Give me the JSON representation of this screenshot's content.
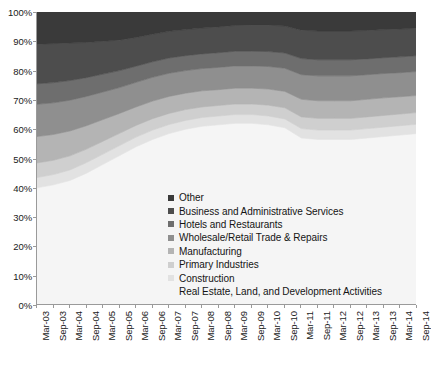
{
  "chart_data": {
    "type": "area",
    "title": "",
    "xlabel": "",
    "ylabel": "",
    "stacked": true,
    "normalized": true,
    "grid": false,
    "legend_position": "inside-center-lower",
    "ylim": [
      0,
      100
    ],
    "ytick_labels": [
      "0%",
      "10%",
      "20%",
      "30%",
      "40%",
      "50%",
      "60%",
      "70%",
      "80%",
      "90%",
      "100%"
    ],
    "ytick_values": [
      0,
      10,
      20,
      30,
      40,
      50,
      60,
      70,
      80,
      90,
      100
    ],
    "categories": [
      "Mar-03",
      "Sep-03",
      "Mar-04",
      "Sep-04",
      "Mar-05",
      "Sep-05",
      "Mar-06",
      "Sep-06",
      "Mar-07",
      "Sep-07",
      "Mar-08",
      "Sep-08",
      "Mar-09",
      "Sep-09",
      "Mar-10",
      "Sep-10",
      "Mar-11",
      "Sep-11",
      "Mar-12",
      "Sep-12",
      "Mar-13",
      "Sep-13",
      "Mar-14",
      "Sep-14"
    ],
    "series": [
      {
        "name": "Real Estate, Land, and Development Activities",
        "color": "#f5f5f5",
        "values": [
          40.0,
          41.0,
          42.5,
          45.0,
          48.0,
          51.0,
          54.0,
          56.5,
          58.5,
          60.0,
          61.0,
          61.5,
          62.0,
          62.0,
          61.5,
          60.5,
          57.0,
          56.5,
          56.5,
          56.5,
          57.0,
          57.5,
          58.0,
          58.5
        ]
      },
      {
        "name": "Construction",
        "color": "#e2e2e2",
        "values": [
          3.5,
          3.5,
          3.6,
          3.6,
          3.5,
          3.4,
          3.3,
          3.2,
          3.1,
          3.0,
          3.0,
          3.0,
          3.0,
          3.0,
          3.0,
          3.0,
          3.2,
          3.2,
          3.2,
          3.2,
          3.2,
          3.2,
          3.2,
          3.2
        ]
      },
      {
        "name": "Primary Industries",
        "color": "#cfcfcf",
        "values": [
          5.0,
          4.9,
          4.8,
          4.6,
          4.4,
          4.2,
          4.0,
          3.9,
          3.8,
          3.7,
          3.6,
          3.6,
          3.6,
          3.6,
          3.7,
          3.8,
          4.0,
          4.0,
          4.0,
          4.0,
          4.0,
          4.0,
          4.0,
          4.0
        ]
      },
      {
        "name": "Manufacturing",
        "color": "#b4b4b4",
        "values": [
          9.0,
          8.8,
          8.5,
          8.0,
          7.4,
          6.8,
          6.3,
          6.0,
          5.8,
          5.6,
          5.5,
          5.4,
          5.4,
          5.4,
          5.5,
          5.6,
          6.0,
          6.0,
          6.0,
          6.0,
          6.0,
          6.0,
          5.9,
          5.8
        ]
      },
      {
        "name": "Wholesale/Retail Trade & Repairs",
        "color": "#8f8f8f",
        "values": [
          11.0,
          10.8,
          10.5,
          10.0,
          9.4,
          8.8,
          8.4,
          8.1,
          7.9,
          7.7,
          7.6,
          7.6,
          7.6,
          7.6,
          7.7,
          7.9,
          8.4,
          8.5,
          8.5,
          8.5,
          8.4,
          8.3,
          8.2,
          8.2
        ]
      },
      {
        "name": "Hotels and Restaurants",
        "color": "#6e6e6e",
        "values": [
          7.0,
          6.9,
          6.7,
          6.4,
          6.1,
          5.8,
          5.5,
          5.3,
          5.2,
          5.1,
          5.0,
          5.0,
          5.0,
          5.0,
          5.1,
          5.2,
          5.5,
          5.5,
          5.5,
          5.5,
          5.4,
          5.4,
          5.4,
          5.4
        ]
      },
      {
        "name": "Business and Administrative Services",
        "color": "#4d4d4d",
        "values": [
          13.5,
          13.3,
          12.8,
          12.0,
          11.2,
          10.4,
          9.8,
          9.4,
          9.1,
          8.9,
          8.8,
          8.8,
          8.8,
          8.9,
          9.0,
          9.2,
          9.7,
          9.8,
          9.8,
          9.8,
          9.7,
          9.6,
          9.5,
          9.4
        ]
      },
      {
        "name": "Other",
        "color": "#3a3a3a",
        "values": [
          11.0,
          10.8,
          10.6,
          10.4,
          10.0,
          9.6,
          8.7,
          7.6,
          6.6,
          6.0,
          5.5,
          5.1,
          4.6,
          4.5,
          4.5,
          4.8,
          6.2,
          6.5,
          6.5,
          6.5,
          6.3,
          6.0,
          5.8,
          5.5
        ]
      }
    ],
    "legend_entries": [
      {
        "label": "Other",
        "color": "#3a3a3a"
      },
      {
        "label": "Business and Administrative Services",
        "color": "#4d4d4d"
      },
      {
        "label": "Hotels and Restaurants",
        "color": "#6e6e6e"
      },
      {
        "label": "Wholesale/Retail Trade & Repairs",
        "color": "#8f8f8f"
      },
      {
        "label": "Manufacturing",
        "color": "#b4b4b4"
      },
      {
        "label": "Primary Industries",
        "color": "#cfcfcf"
      },
      {
        "label": "Construction",
        "color": "#e2e2e2"
      },
      {
        "label": "Real Estate, Land, and Development Activities",
        "color": "#ffffff"
      }
    ]
  }
}
